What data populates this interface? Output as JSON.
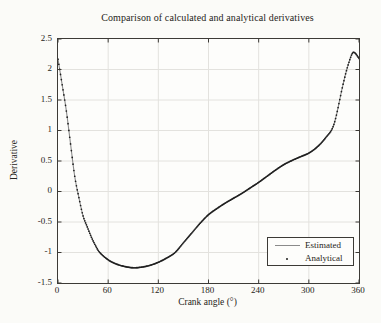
{
  "figure": {
    "background_color": "#fbfbf8",
    "plot_background_color": "#fdfdfb",
    "axis_color": "#3c3a36",
    "grid_color": "#e3e2de",
    "text_color": "#262420"
  },
  "chart_data": {
    "type": "line",
    "title": "Comparison of calculated and analytical derivatives",
    "xlabel": "Crank angle (°)",
    "ylabel": "Derivative",
    "xlim": [
      0,
      360
    ],
    "ylim": [
      -1.5,
      2.5
    ],
    "x_ticks": [
      0,
      60,
      120,
      180,
      240,
      300,
      360
    ],
    "x_tick_labels": [
      "0",
      "60",
      "120",
      "180",
      "240",
      "300",
      "360"
    ],
    "y_ticks": [
      -1.5,
      -1,
      -0.5,
      0,
      0.5,
      1,
      1.5,
      2,
      2.5
    ],
    "y_tick_labels": [
      "-1.5",
      "-1",
      "-0.5",
      "0",
      "0.5",
      "1",
      "1.5",
      "2",
      "2.5"
    ],
    "grid": true,
    "legend_position": "lower right",
    "series": [
      {
        "name": "Estimated",
        "style": "solid line",
        "color": "#8a8a8a",
        "points": [
          [
            0,
            2.17
          ],
          [
            5,
            1.75
          ],
          [
            10,
            1.32
          ],
          [
            15,
            0.78
          ],
          [
            20,
            0.25
          ],
          [
            25,
            -0.1
          ],
          [
            30,
            -0.4
          ],
          [
            35,
            -0.58
          ],
          [
            40,
            -0.75
          ],
          [
            45,
            -0.89
          ],
          [
            50,
            -1.0
          ],
          [
            60,
            -1.12
          ],
          [
            70,
            -1.19
          ],
          [
            80,
            -1.23
          ],
          [
            90,
            -1.25
          ],
          [
            100,
            -1.24
          ],
          [
            110,
            -1.21
          ],
          [
            120,
            -1.16
          ],
          [
            130,
            -1.09
          ],
          [
            140,
            -1.0
          ],
          [
            150,
            -0.84
          ],
          [
            160,
            -0.68
          ],
          [
            170,
            -0.52
          ],
          [
            180,
            -0.38
          ],
          [
            190,
            -0.28
          ],
          [
            200,
            -0.19
          ],
          [
            210,
            -0.11
          ],
          [
            220,
            -0.03
          ],
          [
            230,
            0.06
          ],
          [
            240,
            0.15
          ],
          [
            250,
            0.25
          ],
          [
            260,
            0.35
          ],
          [
            270,
            0.44
          ],
          [
            280,
            0.51
          ],
          [
            290,
            0.57
          ],
          [
            300,
            0.63
          ],
          [
            310,
            0.73
          ],
          [
            320,
            0.88
          ],
          [
            330,
            1.1
          ],
          [
            340,
            1.7
          ],
          [
            345,
            1.98
          ],
          [
            350,
            2.2
          ],
          [
            353,
            2.28
          ],
          [
            356,
            2.26
          ],
          [
            360,
            2.18
          ]
        ]
      },
      {
        "name": "Analytical",
        "style": "dot markers",
        "color": "#1f1f1f",
        "coincident_with": "Estimated",
        "marker_interval_deg": 1
      }
    ]
  }
}
